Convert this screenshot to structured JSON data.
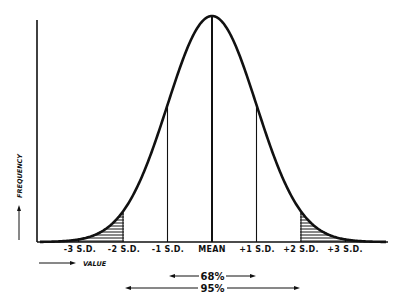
{
  "diagram": {
    "type": "normal-distribution-curve",
    "y_axis_label": "FREQUENCY",
    "x_axis_label": "VALUE",
    "tick_labels": [
      "-3 S.D.",
      "-2 S.D.",
      "-1 S.D.",
      "MEAN",
      "+1 S.D.",
      "+2 S.D.",
      "+3 S.D."
    ],
    "ranges": [
      {
        "label": "68%",
        "from": "-1 S.D.",
        "to": "+1 S.D."
      },
      {
        "label": "95%",
        "from": "-2 S.D.",
        "to": "+2 S.D."
      }
    ],
    "shaded_regions": [
      "below -2 S.D.",
      "above +2 S.D."
    ],
    "colors": {
      "ink": "#111111",
      "background": "#ffffff"
    }
  }
}
